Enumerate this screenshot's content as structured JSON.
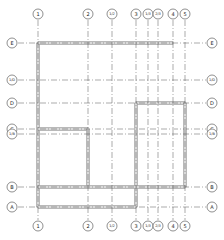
{
  "drawing": {
    "type": "structural-grid-plan",
    "colors": {
      "grid_line": "#555555",
      "wall": "#888888",
      "wall_fill": "#d8d8d8",
      "bubble": "#444444"
    },
    "columns": [
      {
        "label": "1",
        "x": 38
      },
      {
        "label": "2",
        "x": 88
      },
      {
        "label": "1/2",
        "x": 112
      },
      {
        "label": "3",
        "x": 136
      },
      {
        "label": "1/3",
        "x": 148
      },
      {
        "label": "2/3",
        "x": 158
      },
      {
        "label": "4",
        "x": 173
      },
      {
        "label": "5",
        "x": 185
      }
    ],
    "rows": [
      {
        "label": "E",
        "y": 43
      },
      {
        "label": "1/D",
        "y": 80
      },
      {
        "label": "D",
        "y": 103
      },
      {
        "label": "C",
        "y": 129
      },
      {
        "label": "1/B",
        "y": 134
      },
      {
        "label": "B",
        "y": 187
      },
      {
        "label": "A",
        "y": 207
      }
    ]
  }
}
